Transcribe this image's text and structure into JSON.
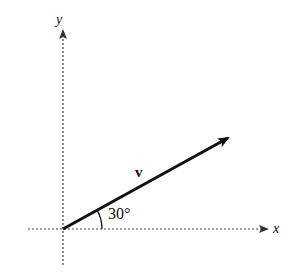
{
  "diagram": {
    "axes": {
      "x_label": "x",
      "y_label": "y"
    },
    "vector": {
      "label": "v",
      "angle_label": "30°",
      "angle_deg": 30
    },
    "colors": {
      "ink": "#111111",
      "axis": "#444444"
    }
  }
}
